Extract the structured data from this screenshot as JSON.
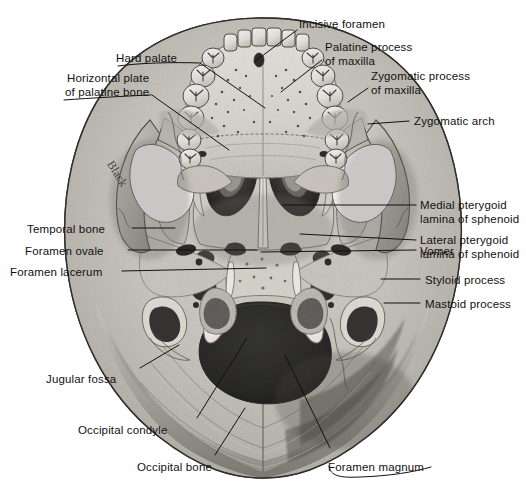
{
  "figure": {
    "watermark_text": "Black",
    "background_color": "#ffffff",
    "line_color": "#111111",
    "bone_light": "#e8e5df",
    "bone_mid": "#b9b5ad",
    "bone_dark": "#7d7a73",
    "cavity_black": "#111111"
  },
  "labels": [
    {
      "id": "incisive-foramen",
      "text": "Incisive foramen",
      "align": "left",
      "x": 299,
      "y": 18,
      "lines": [
        "Incisive foramen"
      ]
    },
    {
      "id": "hard-palate",
      "text": "Hard palate",
      "align": "right",
      "x": 116,
      "y": 52,
      "lines": [
        "Hard palate"
      ]
    },
    {
      "id": "palatine-process-of-maxilla",
      "text": "Palatine process of maxilla",
      "align": "left",
      "x": 325,
      "y": 41,
      "lines": [
        "Palatine process",
        "of maxilla"
      ]
    },
    {
      "id": "horizontal-plate-of-palatine-bone",
      "text": "Horizontal plate of palatine bone",
      "align": "right",
      "x": 65,
      "y": 72,
      "lines": [
        "Horizontal plate",
        "of palatine bone"
      ]
    },
    {
      "id": "zygomatic-process-of-maxilla",
      "text": "Zygomatic process of maxilla",
      "align": "left",
      "x": 371,
      "y": 70,
      "lines": [
        "Zygomatic process",
        "of maxilla"
      ]
    },
    {
      "id": "zygomatic-arch",
      "text": "Zygomatic arch",
      "align": "left",
      "x": 414,
      "y": 115,
      "lines": [
        "Zygomatic arch"
      ]
    },
    {
      "id": "medial-pterygoid-lamina-of-sphenoid",
      "text": "Medial pterygoid lamina of sphenoid",
      "align": "left",
      "x": 420,
      "y": 199,
      "lines": [
        "Medial pterygoid",
        "lamina of sphenoid"
      ]
    },
    {
      "id": "lateral-pterygoid-lamina-of-sphenoid",
      "text": "Lateral pterygoid lamina of sphenoid",
      "align": "left",
      "x": 420,
      "y": 234,
      "lines": [
        "Lateral pterygoid",
        "lamina of sphenoid"
      ]
    },
    {
      "id": "temporal-bone",
      "text": "Temporal bone",
      "align": "right",
      "x": 27,
      "y": 223,
      "lines": [
        "Temporal bone"
      ]
    },
    {
      "id": "foramen-ovale",
      "text": "Foramen ovale",
      "align": "right",
      "x": 25,
      "y": 245,
      "lines": [
        "Foramen ovale"
      ]
    },
    {
      "id": "foramen-lacerum",
      "text": "Foramen lacerum",
      "align": "right",
      "x": 10,
      "y": 266,
      "lines": [
        "Foramen lacerum"
      ]
    },
    {
      "id": "vomer",
      "text": "Vomer",
      "align": "left",
      "x": 420,
      "y": 245,
      "lines": [
        "Vomer"
      ]
    },
    {
      "id": "styloid-process",
      "text": "Styloid process",
      "align": "left",
      "x": 425,
      "y": 274,
      "lines": [
        "Styloid process"
      ]
    },
    {
      "id": "mastoid-process",
      "text": "Mastoid process",
      "align": "left",
      "x": 425,
      "y": 298,
      "lines": [
        "Mastoid process"
      ]
    },
    {
      "id": "jugular-fossa",
      "text": "Jugular fossa",
      "align": "right",
      "x": 46,
      "y": 373,
      "lines": [
        "Jugular fossa"
      ]
    },
    {
      "id": "occipital-condyle",
      "text": "Occipital condyle",
      "align": "right",
      "x": 78,
      "y": 424,
      "lines": [
        "Occipital condyle"
      ]
    },
    {
      "id": "occipital-bone",
      "text": "Occipital bone",
      "align": "right",
      "x": 137,
      "y": 461,
      "lines": [
        "Occipital bone"
      ]
    },
    {
      "id": "foramen-magnum",
      "text": "Foramen magnum",
      "align": "left",
      "x": 328,
      "y": 461,
      "lines": [
        "Foramen magnum"
      ]
    }
  ],
  "leader_lines": [
    {
      "id": "leader-incisive-foramen",
      "points": "297,30 254,62"
    },
    {
      "id": "leader-hard-palate",
      "points": "200,63 265,108"
    },
    {
      "id": "leader-palatine-process",
      "points": "322,60 281,92"
    },
    {
      "id": "leader-horizontal-plate",
      "points": "152,95 229,150"
    },
    {
      "id": "leader-zygomatic-process",
      "points": "368,88 348,102"
    },
    {
      "id": "leader-zygomatic-arch",
      "points": "409,121 368,124"
    },
    {
      "id": "leader-medial-pterygoid",
      "points": "416,205 283,205"
    },
    {
      "id": "leader-lateral-pterygoid",
      "points": "416,240 300,234"
    },
    {
      "id": "leader-temporal-bone",
      "points": "132,228 175,228"
    },
    {
      "id": "leader-foramen-ovale",
      "points": "128,250 257,250"
    },
    {
      "id": "leader-foramen-lacerum",
      "points": "122,271 266,268"
    },
    {
      "id": "leader-vomer",
      "points": "416,250 261,252"
    },
    {
      "id": "leader-styloid-process",
      "points": "420,279 381,279"
    },
    {
      "id": "leader-mastoid-process",
      "points": "420,303 384,303"
    },
    {
      "id": "leader-jugular-fossa",
      "points": "140,368 179,345"
    },
    {
      "id": "leader-occipital-condyle",
      "points": "197,418 247,338"
    },
    {
      "id": "leader-occipital-bone",
      "points": "215,455 245,408"
    },
    {
      "id": "leader-foramen-magnum",
      "points": "330,448 285,355"
    }
  ],
  "underline_brackets": [
    {
      "id": "bracket-hard-palate",
      "path": "M 118,66 C 140,63 172,62 199,63"
    },
    {
      "id": "bracket-horizontal-plate",
      "path": "M 64,100 C 92,98 126,96 151,95"
    },
    {
      "id": "bracket-foramen-magnum",
      "path": "M 329,466 C 330,476 340,478 360,477 C 390,476 414,472 431,467"
    }
  ]
}
